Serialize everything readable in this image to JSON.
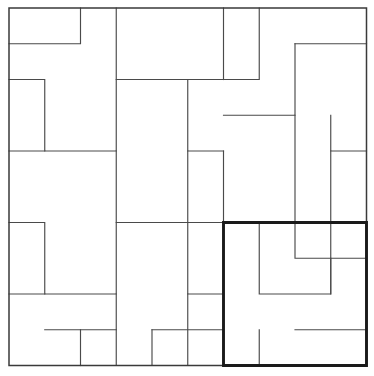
{
  "figure": {
    "type": "geometric-tiling-diagram",
    "background_color": "#ffffff",
    "line_color": "#4a4a4a",
    "border_color": "#3a3a3a",
    "highlight_color": "#1a1a1a"
  },
  "geometry": {
    "origin_x": 9,
    "origin_y": 8,
    "unit": 35.75,
    "grid_cols": 10,
    "grid_rows": 10,
    "outer_square": {
      "x0": 0,
      "y0": 0,
      "x1": 10,
      "y1": 10
    },
    "highlight_square": {
      "x0": 6,
      "y0": 6,
      "x1": 10,
      "y1": 10,
      "label": "bold sub-square"
    }
  },
  "chart_data": {
    "type": "diagram",
    "xlabel": "",
    "ylabel": "",
    "grid": false,
    "legend": "none",
    "xlim": [
      0,
      10
    ],
    "ylim": [
      0,
      10
    ],
    "outer_square": [
      [
        0,
        0
      ],
      [
        10,
        0
      ],
      [
        10,
        10
      ],
      [
        0,
        10
      ],
      [
        0,
        0
      ]
    ],
    "highlight_square": [
      [
        6,
        6
      ],
      [
        10,
        6
      ],
      [
        10,
        10
      ],
      [
        6,
        10
      ],
      [
        6,
        6
      ]
    ],
    "interior_edges": [
      [
        [
          0,
          1
        ],
        [
          2,
          1
        ],
        [
          2,
          0
        ]
      ],
      [
        [
          3,
          0
        ],
        [
          3,
          2
        ],
        [
          5,
          2
        ]
      ],
      [
        [
          6,
          2
        ],
        [
          6,
          0
        ]
      ],
      [
        [
          7,
          0
        ],
        [
          7,
          2
        ],
        [
          5,
          2
        ]
      ],
      [
        [
          8,
          1
        ],
        [
          10,
          1
        ]
      ],
      [
        [
          0,
          2
        ],
        [
          1,
          2
        ],
        [
          1,
          4
        ],
        [
          3,
          4
        ],
        [
          3,
          2
        ]
      ],
      [
        [
          5,
          2
        ],
        [
          5,
          4
        ],
        [
          6,
          4
        ]
      ],
      [
        [
          6,
          3
        ],
        [
          8,
          3
        ],
        [
          8,
          1
        ]
      ],
      [
        [
          9,
          3
        ],
        [
          9,
          4
        ],
        [
          10,
          4
        ]
      ],
      [
        [
          0,
          4
        ],
        [
          1,
          4
        ]
      ],
      [
        [
          3,
          4
        ],
        [
          3,
          6
        ],
        [
          5,
          6
        ],
        [
          5,
          4
        ]
      ],
      [
        [
          6,
          4
        ],
        [
          6,
          6
        ],
        [
          4,
          6
        ]
      ],
      [
        [
          8,
          3
        ],
        [
          8,
          6
        ]
      ],
      [
        [
          9,
          4
        ],
        [
          9,
          6
        ],
        [
          10,
          6
        ]
      ],
      [
        [
          0,
          6
        ],
        [
          1,
          6
        ],
        [
          1,
          8
        ],
        [
          3,
          8
        ],
        [
          3,
          6
        ]
      ],
      [
        [
          5,
          6
        ],
        [
          5,
          8
        ],
        [
          6,
          8
        ]
      ],
      [
        [
          6,
          6
        ],
        [
          6,
          8
        ]
      ],
      [
        [
          8,
          6
        ],
        [
          8,
          7
        ],
        [
          10,
          7
        ]
      ],
      [
        [
          0,
          8
        ],
        [
          1,
          8
        ]
      ],
      [
        [
          3,
          8
        ],
        [
          3,
          10
        ]
      ],
      [
        [
          5,
          8
        ],
        [
          5,
          10
        ]
      ],
      [
        [
          6,
          8
        ],
        [
          6,
          10
        ]
      ],
      [
        [
          7,
          6
        ],
        [
          7,
          8
        ],
        [
          9,
          8
        ],
        [
          9,
          6
        ]
      ],
      [
        [
          8,
          9
        ],
        [
          10,
          9
        ]
      ],
      [
        [
          7,
          9
        ],
        [
          7,
          10
        ]
      ],
      [
        [
          2,
          9
        ],
        [
          2,
          10
        ]
      ],
      [
        [
          1,
          9
        ],
        [
          3,
          9
        ]
      ],
      [
        [
          4,
          9
        ],
        [
          4,
          10
        ]
      ],
      [
        [
          4,
          9
        ],
        [
          6,
          9
        ]
      ],
      [
        [
          9,
          7
        ],
        [
          9,
          8
        ]
      ]
    ]
  }
}
